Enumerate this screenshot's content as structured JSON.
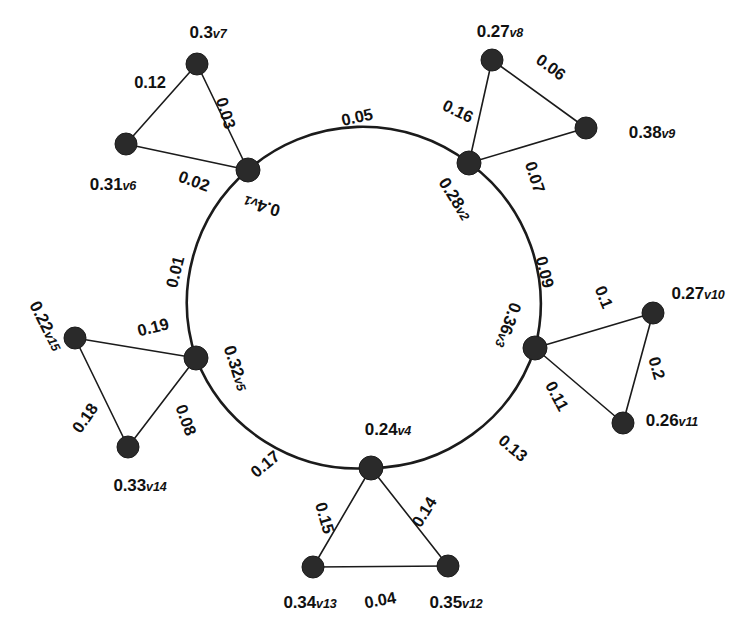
{
  "figure": {
    "title": "",
    "background_color": "#ffffff",
    "node_color": "#2a2a2a",
    "edge_color": "#1b1b1b"
  },
  "chart_data": {
    "type": "diagram",
    "subtype": "weighted-undirected-graph",
    "title": "",
    "node_count": 15,
    "edge_count": 20,
    "layout": "ring-of-five-hubs-with-attached-triangles",
    "nodes": [
      {
        "id": "v1",
        "label": "0.4",
        "sub": "v1",
        "value": 0.4,
        "x": 248,
        "y": 170,
        "r": 12,
        "kind": "ring"
      },
      {
        "id": "v2",
        "label": "0.28",
        "sub": "v2",
        "value": 0.28,
        "x": 469,
        "y": 163,
        "r": 12,
        "kind": "ring"
      },
      {
        "id": "v3",
        "label": "0.36",
        "sub": "v3",
        "value": 0.36,
        "x": 535,
        "y": 348,
        "r": 12,
        "kind": "ring"
      },
      {
        "id": "v4",
        "label": "0.24",
        "sub": "v4",
        "value": 0.24,
        "x": 371,
        "y": 468,
        "r": 12,
        "kind": "ring"
      },
      {
        "id": "v5",
        "label": "0.32",
        "sub": "v5",
        "value": 0.32,
        "x": 196,
        "y": 358,
        "r": 12,
        "kind": "ring"
      },
      {
        "id": "v6",
        "label": "0.31",
        "sub": "v6",
        "value": 0.31,
        "x": 126,
        "y": 144,
        "r": 11,
        "kind": "leaf"
      },
      {
        "id": "v7",
        "label": "0.3",
        "sub": "v7",
        "value": 0.3,
        "x": 197,
        "y": 64,
        "r": 11,
        "kind": "leaf"
      },
      {
        "id": "v8",
        "label": "0.27",
        "sub": "v8",
        "value": 0.27,
        "x": 492,
        "y": 60,
        "r": 11,
        "kind": "leaf"
      },
      {
        "id": "v9",
        "label": "0.38",
        "sub": "v9",
        "value": 0.38,
        "x": 586,
        "y": 128,
        "r": 11,
        "kind": "leaf"
      },
      {
        "id": "v10",
        "label": "0.27",
        "sub": "v10",
        "value": 0.27,
        "x": 653,
        "y": 313,
        "r": 11,
        "kind": "leaf"
      },
      {
        "id": "v11",
        "label": "0.26",
        "sub": "v11",
        "value": 0.26,
        "x": 623,
        "y": 423,
        "r": 11,
        "kind": "leaf"
      },
      {
        "id": "v12",
        "label": "0.35",
        "sub": "v12",
        "value": 0.35,
        "x": 448,
        "y": 566,
        "r": 11,
        "kind": "leaf"
      },
      {
        "id": "v13",
        "label": "0.34",
        "sub": "v13",
        "value": 0.34,
        "x": 313,
        "y": 567,
        "r": 11,
        "kind": "leaf"
      },
      {
        "id": "v14",
        "label": "0.33",
        "sub": "v14",
        "value": 0.33,
        "x": 128,
        "y": 447,
        "r": 11,
        "kind": "leaf"
      },
      {
        "id": "v15",
        "label": "0.22",
        "sub": "v15",
        "value": 0.22,
        "x": 75,
        "y": 338,
        "r": 11,
        "kind": "leaf"
      }
    ],
    "edges": [
      {
        "source": "v1",
        "target": "v2",
        "weight": 0.05,
        "label": "0.05",
        "style": "arc"
      },
      {
        "source": "v2",
        "target": "v3",
        "weight": 0.09,
        "label": "0.09",
        "style": "arc"
      },
      {
        "source": "v3",
        "target": "v4",
        "weight": 0.13,
        "label": "0.13",
        "style": "arc"
      },
      {
        "source": "v4",
        "target": "v5",
        "weight": 0.17,
        "label": "0.17",
        "style": "arc"
      },
      {
        "source": "v5",
        "target": "v1",
        "weight": 0.01,
        "label": "0.01",
        "style": "arc"
      },
      {
        "source": "v6",
        "target": "v7",
        "weight": 0.12,
        "label": "0.12",
        "style": "line"
      },
      {
        "source": "v7",
        "target": "v1",
        "weight": 0.03,
        "label": "0.03",
        "style": "line"
      },
      {
        "source": "v6",
        "target": "v1",
        "weight": 0.02,
        "label": "0.02",
        "style": "line"
      },
      {
        "source": "v8",
        "target": "v2",
        "weight": 0.16,
        "label": "0.16",
        "style": "line"
      },
      {
        "source": "v8",
        "target": "v9",
        "weight": 0.06,
        "label": "0.06",
        "style": "line"
      },
      {
        "source": "v9",
        "target": "v2",
        "weight": 0.07,
        "label": "0.07",
        "style": "line"
      },
      {
        "source": "v3",
        "target": "v10",
        "weight": 0.1,
        "label": "0.1",
        "style": "line"
      },
      {
        "source": "v10",
        "target": "v11",
        "weight": 0.2,
        "label": "0.2",
        "style": "line"
      },
      {
        "source": "v3",
        "target": "v11",
        "weight": 0.11,
        "label": "0.11",
        "style": "line"
      },
      {
        "source": "v4",
        "target": "v13",
        "weight": 0.15,
        "label": "0.15",
        "style": "line"
      },
      {
        "source": "v4",
        "target": "v12",
        "weight": 0.14,
        "label": "0.14",
        "style": "line"
      },
      {
        "source": "v13",
        "target": "v12",
        "weight": 0.04,
        "label": "0.04",
        "style": "line"
      },
      {
        "source": "v5",
        "target": "v15",
        "weight": 0.19,
        "label": "0.19",
        "style": "line"
      },
      {
        "source": "v15",
        "target": "v14",
        "weight": 0.18,
        "label": "0.18",
        "style": "line"
      },
      {
        "source": "v5",
        "target": "v14",
        "weight": 0.08,
        "label": "0.08",
        "style": "line"
      }
    ],
    "node_labels": {
      "v1": {
        "text": "0.4",
        "sub": "v1",
        "x": 262,
        "y": 206,
        "rot": 196
      },
      "v2": {
        "text": "0.28",
        "sub": "v2",
        "x": 455,
        "y": 199,
        "rot": 58
      },
      "v3": {
        "text": "0.36",
        "sub": "v3",
        "x": 508,
        "y": 325,
        "rot": 110
      },
      "v4": {
        "text": "0.24",
        "sub": "v4",
        "x": 388,
        "y": 429,
        "rot": 0
      },
      "v5": {
        "text": "0.32",
        "sub": "v5",
        "x": 236,
        "y": 368,
        "rot": 72
      },
      "v6": {
        "text": "0.31",
        "sub": "v6",
        "x": 113,
        "y": 184,
        "rot": 0
      },
      "v7": {
        "text": "0.3",
        "sub": "v7",
        "x": 208,
        "y": 32,
        "rot": 0
      },
      "v8": {
        "text": "0.27",
        "sub": "v8",
        "x": 500,
        "y": 31,
        "rot": 0
      },
      "v9": {
        "text": "0.38",
        "sub": "v9",
        "x": 652,
        "y": 132,
        "rot": 0
      },
      "v10": {
        "text": "0.27",
        "sub": "v10",
        "x": 698,
        "y": 293,
        "rot": 0
      },
      "v11": {
        "text": "0.26",
        "sub": "v11",
        "x": 672,
        "y": 420,
        "rot": 0
      },
      "v12": {
        "text": "0.35",
        "sub": "v12",
        "x": 456,
        "y": 602,
        "rot": 0
      },
      "v13": {
        "text": "0.34",
        "sub": "v13",
        "x": 310,
        "y": 602,
        "rot": 0
      },
      "v14": {
        "text": "0.33",
        "sub": "v14",
        "x": 140,
        "y": 485,
        "rot": 0
      },
      "v15": {
        "text": "0.22",
        "sub": "v15",
        "x": 46,
        "y": 326,
        "rot": 63
      }
    },
    "edge_labels": {
      "e_v1_v2": {
        "text": "0.05",
        "x": 357,
        "y": 117,
        "rot": -12
      },
      "e_v2_v3": {
        "text": "0.09",
        "x": 545,
        "y": 272,
        "rot": 76
      },
      "e_v3_v4": {
        "text": "0.13",
        "x": 513,
        "y": 448,
        "rot": 40
      },
      "e_v4_v5": {
        "text": "0.17",
        "x": 265,
        "y": 464,
        "rot": -40
      },
      "e_v5_v1": {
        "text": "0.01",
        "x": 175,
        "y": 272,
        "rot": -76
      },
      "e_v6_v7": {
        "text": "0.12",
        "x": 150,
        "y": 82,
        "rot": 0
      },
      "e_v7_v1": {
        "text": "0.03",
        "x": 226,
        "y": 113,
        "rot": 73
      },
      "e_v6_v1": {
        "text": "0.02",
        "x": 194,
        "y": 181,
        "rot": 20
      },
      "e_v8_v2": {
        "text": "0.16",
        "x": 458,
        "y": 111,
        "rot": 26
      },
      "e_v8_v9": {
        "text": "0.06",
        "x": 551,
        "y": 67,
        "rot": 36
      },
      "e_v9_v2": {
        "text": "0.07",
        "x": 535,
        "y": 177,
        "rot": 72
      },
      "e_v3_v10": {
        "text": "0.1",
        "x": 604,
        "y": 297,
        "rot": 68
      },
      "e_v10_v11": {
        "text": "0.2",
        "x": 657,
        "y": 368,
        "rot": 74
      },
      "e_v3_v11": {
        "text": "0.11",
        "x": 557,
        "y": 396,
        "rot": 62
      },
      "e_v4_v13": {
        "text": "0.15",
        "x": 325,
        "y": 518,
        "rot": 74
      },
      "e_v4_v12": {
        "text": "0.14",
        "x": 424,
        "y": 512,
        "rot": -58
      },
      "e_v13_v12": {
        "text": "0.04",
        "x": 380,
        "y": 600,
        "rot": -10
      },
      "e_v5_v15": {
        "text": "0.19",
        "x": 153,
        "y": 327,
        "rot": -14
      },
      "e_v15_v14": {
        "text": "0.18",
        "x": 85,
        "y": 418,
        "rot": -55
      },
      "e_v5_v14": {
        "text": "0.08",
        "x": 186,
        "y": 420,
        "rot": 70
      }
    }
  }
}
